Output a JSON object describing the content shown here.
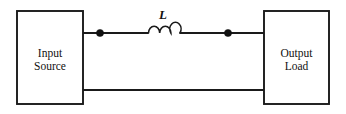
{
  "diagram": {
    "type": "electrical-circuit-schematic",
    "background_color": "#ffffff",
    "line_color": "#1a1a1a",
    "blocks": [
      {
        "id": "input-source",
        "label_line1": "Input",
        "label_line2": "Source",
        "x": 17,
        "y": 11,
        "width": 66,
        "height": 93
      },
      {
        "id": "output-load",
        "label_line1": "Output",
        "label_line2": "Load",
        "x": 264,
        "y": 11,
        "width": 65,
        "height": 93
      }
    ],
    "components": [
      {
        "id": "inductor-l",
        "type": "inductor",
        "label": "L",
        "loops": 3,
        "x_start": 148,
        "x_end": 180,
        "wire_y": 33,
        "label_x": 163,
        "label_y": 19
      }
    ],
    "nodes": [
      {
        "id": "node-left",
        "x": 100,
        "y": 33,
        "radius": 3.6
      },
      {
        "id": "node-right",
        "x": 228,
        "y": 33,
        "radius": 3.6
      }
    ],
    "wires": [
      {
        "id": "top-wire-left",
        "x1": 83,
        "y1": 33,
        "x2": 148,
        "y2": 33
      },
      {
        "id": "top-wire-right",
        "x1": 180,
        "y1": 33,
        "x2": 264,
        "y2": 33
      },
      {
        "id": "bottom-wire",
        "x1": 83,
        "y1": 90,
        "x2": 264,
        "y2": 90
      }
    ]
  }
}
